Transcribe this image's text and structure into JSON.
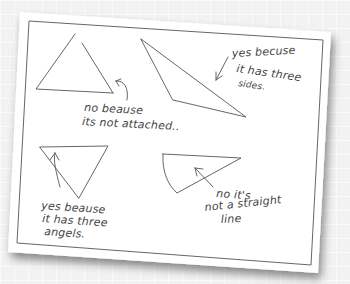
{
  "worksheet": {
    "shapes": [
      {
        "name": "open-triangle",
        "description": "triangle with gap at top",
        "answer_lines": [
          "no beause",
          "its not attached.."
        ]
      },
      {
        "name": "obtuse-triangle",
        "description": "long obtuse triangle",
        "answer_lines": [
          "yes becuse",
          "it has three",
          "sides."
        ]
      },
      {
        "name": "inverted-triangle",
        "description": "upside-down triangle",
        "answer_lines": [
          "yes beause",
          "it has three",
          "angels."
        ]
      },
      {
        "name": "sector-shape",
        "description": "shape with a curved side",
        "answer_lines": [
          "no it's",
          "not a straight",
          "line"
        ]
      }
    ]
  },
  "colors": {
    "paper": "#ffffff",
    "ink": "#444444",
    "border": "#555555",
    "background": "#f2f2f2"
  }
}
